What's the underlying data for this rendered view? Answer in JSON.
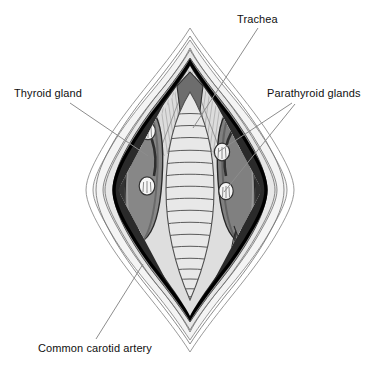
{
  "figure": {
    "view": "anterior surgical exposure",
    "background_color": "#ffffff"
  },
  "labels": {
    "trachea": "Trachea",
    "thyroid_gland": "Thyroid gland",
    "parathyroid_glands": "Parathyroid glands",
    "common_carotid_artery": "Common carotid artery"
  },
  "colors": {
    "ink": "#101010",
    "leader_line": "#8d8d8d",
    "skin_outer": "#ffffff",
    "subcutaneous": "#efefef",
    "fascia_light": "#e3e3e3",
    "retracted_tissue": "#9b9b9b",
    "muscle_dark": "#3b3b3b",
    "muscle_mid": "#6f6f6f",
    "thyroid_lobe": "#858585",
    "trachea_body": "#e6e6e6",
    "trachea_ring_line": "#585858",
    "parathyroid": "#f4f4f4",
    "vessel_white": "#fbfbfb",
    "cartilage_notch": "#6a6a6a"
  },
  "structures": {
    "trachea": {
      "name": "trachea",
      "ring_count": 17,
      "description": "midline airway with stacked cartilage rings"
    },
    "thyroid_lobes": {
      "name": "thyroid gland",
      "count": 2,
      "sides": [
        "left",
        "right"
      ],
      "description": "paired elongated lobes flanking the trachea"
    },
    "parathyroid_glands": {
      "name": "parathyroid glands",
      "count": 4,
      "positions": [
        "left superior",
        "left inferior",
        "right superior",
        "right inferior"
      ],
      "description": "four small pale ovoid glands on the posterior thyroid lobes"
    },
    "common_carotid_artery": {
      "name": "common carotid artery",
      "count": 2,
      "description": "pale longitudinal vessels lateral to the thyroid lobes"
    },
    "strap_muscles": {
      "name": "strap muscles",
      "description": "dark retracted muscle bands lateral to midline"
    },
    "thyroid_cartilage_notch": {
      "name": "thyroid cartilage notch",
      "description": "dark triangular notch at superior apex"
    },
    "skin_incision": {
      "name": "skin incision margins",
      "description": "concentric wavy retracted skin and subcutaneous layers"
    }
  },
  "leaders": [
    {
      "label": "trachea",
      "from": [
        258,
        28
      ],
      "to": [
        193,
        128
      ]
    },
    {
      "label": "thyroid_gland",
      "from": [
        70,
        103
      ],
      "to": [
        148,
        156
      ]
    },
    {
      "label": "parathyroid_glands",
      "from": [
        292,
        103
      ],
      "to": [
        218,
        152
      ]
    },
    {
      "label": "parathyroid_glands",
      "from": [
        295,
        104
      ],
      "to": [
        224,
        192
      ]
    },
    {
      "label": "common_carotid_artery",
      "from": [
        96,
        339
      ],
      "to": [
        143,
        264
      ]
    }
  ]
}
